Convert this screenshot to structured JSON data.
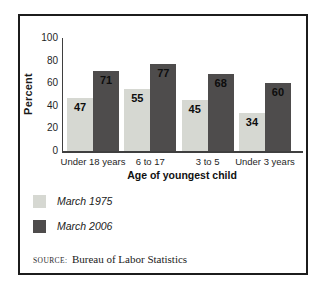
{
  "chart_data": {
    "type": "bar",
    "categories": [
      "Under 18 years",
      "6 to 17",
      "3 to 5",
      "Under 3 years"
    ],
    "series": [
      {
        "name": "March 1975",
        "color": "#d6d8d2",
        "values": [
          47,
          55,
          45,
          34
        ]
      },
      {
        "name": "March 2006",
        "color": "#4e4c4c",
        "values": [
          71,
          77,
          68,
          60
        ]
      }
    ],
    "title": "",
    "xlabel": "Age of youngest child",
    "ylabel": "Percent",
    "ylim": [
      0,
      100
    ],
    "yticks": [
      0,
      20,
      40,
      60,
      80,
      100
    ],
    "grid": false,
    "legend_position": "bottom-left",
    "value_labels": "inside-top"
  },
  "source": {
    "prefix": "SOURCE:",
    "text": "Bureau of Labor Statistics"
  },
  "frame": {
    "border_color": "#1c1c1c",
    "background": "#ffffff"
  }
}
